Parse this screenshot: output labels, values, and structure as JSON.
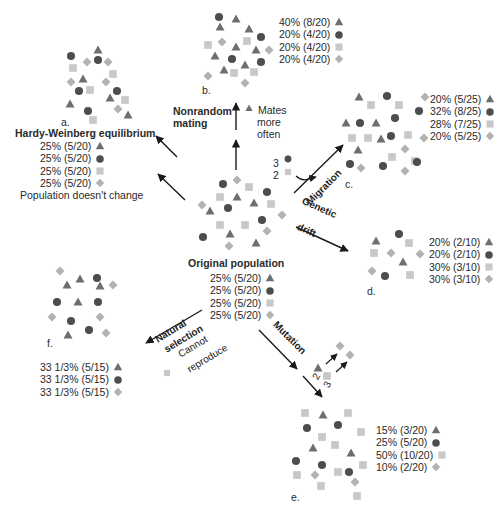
{
  "colors": {
    "triangle": "#6e6e6e",
    "circle": "#4d4d4d",
    "square": "#c8c8c8",
    "diamond": "#b2b2b2",
    "arrow": "#1a1a1a"
  },
  "original": {
    "title": "Original population",
    "stats": [
      "25% (5/20)",
      "25% (5/20)",
      "25% (5/20)",
      "25% (5/20)"
    ]
  },
  "panel_a": {
    "letter": "a.",
    "title": "Hardy-Weinberg equilibrium",
    "stats": [
      "25% (5/20)",
      "25% (5/20)",
      "25% (5/20)",
      "25% (5/20)"
    ],
    "note": "Population doesn't change"
  },
  "panel_b": {
    "letter": "b.",
    "arrow_label": "Nonrandom mating",
    "arrow_label_line1": "Nonrandom",
    "arrow_label_line2": "mating",
    "note_line1": "Mates",
    "note_line2": "more",
    "note_line3": "often",
    "stats": [
      "40% (8/20)",
      "20% (4/20)",
      "20% (4/20)",
      "20% (4/20)"
    ]
  },
  "panel_c": {
    "letter": "c.",
    "arrow_label": "Migration",
    "migrants": [
      {
        "count": "3",
        "shape": "circle"
      },
      {
        "count": "2",
        "shape": "square"
      }
    ],
    "stats": [
      "20% (5/25)",
      "32% (8/25)",
      "28% (7/25)",
      "20% (5/25)"
    ]
  },
  "panel_d": {
    "letter": "d.",
    "arrow_label_line1": "Genetic",
    "arrow_label_line2": "drift",
    "stats": [
      "20% (2/10)",
      "20% (2/10)",
      "30% (3/10)",
      "30% (3/10)"
    ]
  },
  "panel_e": {
    "letter": "e.",
    "arrow_label": "Mutation",
    "mutations": [
      {
        "count": "2",
        "from": "triangle",
        "to": "diamond"
      },
      {
        "count": "3",
        "from": "square",
        "to": "diamond"
      }
    ],
    "stats": [
      "15% (3/20)",
      "25% (5/20)",
      "50% (10/20)",
      "10% (2/20)"
    ]
  },
  "panel_f": {
    "letter": "f.",
    "arrow_label_line1": "Natural",
    "arrow_label_line2": "selection",
    "note_line1": "Cannot",
    "note_line2": "reproduce",
    "stats": [
      "33 1/3% (5/15)",
      "33 1/3% (5/15)",
      "33 1/3% (5/15)"
    ]
  }
}
